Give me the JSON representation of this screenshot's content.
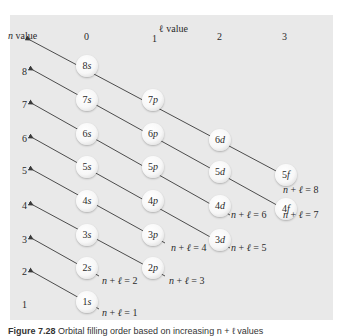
{
  "header": {
    "n_value_label": "n value",
    "l_value_label": "ℓ value",
    "l_values": [
      "0",
      "1",
      "2",
      "3"
    ]
  },
  "n_values": [
    "8",
    "7",
    "6",
    "5",
    "4",
    "3",
    "2",
    "1"
  ],
  "orbitals": [
    {
      "n": "8",
      "l": "s"
    },
    {
      "n": "7",
      "l": "s"
    },
    {
      "n": "6",
      "l": "s"
    },
    {
      "n": "5",
      "l": "s"
    },
    {
      "n": "4",
      "l": "s"
    },
    {
      "n": "3",
      "l": "s"
    },
    {
      "n": "2",
      "l": "s"
    },
    {
      "n": "1",
      "l": "s"
    },
    {
      "n": "7",
      "l": "p"
    },
    {
      "n": "6",
      "l": "p"
    },
    {
      "n": "5",
      "l": "p"
    },
    {
      "n": "4",
      "l": "p"
    },
    {
      "n": "3",
      "l": "p"
    },
    {
      "n": "2",
      "l": "p"
    },
    {
      "n": "6",
      "l": "d"
    },
    {
      "n": "5",
      "l": "d"
    },
    {
      "n": "4",
      "l": "d"
    },
    {
      "n": "3",
      "l": "d"
    },
    {
      "n": "5",
      "l": "f"
    },
    {
      "n": "4",
      "l": "f"
    }
  ],
  "sum_labels": [
    {
      "prefix": "n + ℓ = ",
      "value": "1"
    },
    {
      "prefix": "n + ℓ = ",
      "value": "2"
    },
    {
      "prefix": "n + ℓ = ",
      "value": "3"
    },
    {
      "prefix": "n + ℓ = ",
      "value": "4"
    },
    {
      "prefix": "n + ℓ = ",
      "value": "5"
    },
    {
      "prefix": "n + ℓ = ",
      "value": "6"
    },
    {
      "prefix": "n + ℓ = ",
      "value": "7"
    },
    {
      "prefix": "n + ℓ = ",
      "value": "8"
    }
  ],
  "caption": {
    "figure": "Figure 7.28",
    "text": "Orbital filling order based on increasing n + ℓ values"
  },
  "colors": {
    "panel": "#e9e9e9",
    "line": "#3a3a3a",
    "text": "#2a2a2a"
  }
}
